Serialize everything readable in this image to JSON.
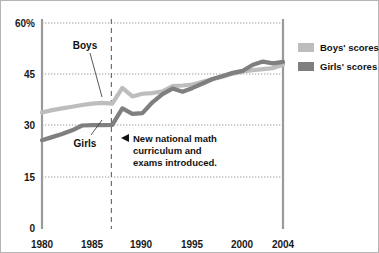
{
  "chart_data": {
    "type": "line",
    "title": "",
    "xlabel": "",
    "ylabel": "",
    "xlim": [
      1980,
      2004
    ],
    "ylim": [
      0,
      60
    ],
    "grid": true,
    "legend_position": "right",
    "y_ticks": [
      "0",
      "15",
      "30",
      "45",
      "60%"
    ],
    "y_tick_values": [
      0,
      15,
      30,
      45,
      60
    ],
    "x_ticks": [
      "1980",
      "1985",
      "1990",
      "1995",
      "2000",
      "2004"
    ],
    "x_tick_values": [
      1980,
      1985,
      1990,
      1995,
      2000,
      2004
    ],
    "x": [
      1980,
      1981,
      1982,
      1983,
      1984,
      1985,
      1986,
      1987,
      1988,
      1989,
      1990,
      1991,
      1992,
      1993,
      1994,
      1995,
      1996,
      1997,
      1998,
      1999,
      2000,
      2001,
      2002,
      2003,
      2004
    ],
    "series": [
      {
        "name": "Boys' scores",
        "color": "#bdbdbd",
        "values": [
          33.8,
          34.5,
          35.0,
          35.5,
          36.0,
          36.4,
          36.6,
          36.4,
          41.0,
          38.5,
          39.3,
          39.5,
          40.0,
          41.5,
          41.7,
          42.0,
          42.8,
          43.6,
          44.3,
          45.2,
          45.8,
          46.2,
          46.5,
          46.8,
          47.8
        ]
      },
      {
        "name": "Girls' scores",
        "color": "#7f7f7f",
        "values": [
          25.7,
          26.6,
          27.5,
          28.6,
          30.0,
          30.1,
          30.1,
          30.2,
          35.0,
          33.4,
          33.6,
          36.8,
          39.2,
          40.8,
          39.9,
          41.0,
          42.3,
          43.6,
          44.5,
          45.4,
          46.0,
          47.8,
          48.7,
          48.2,
          48.6
        ]
      }
    ],
    "annotations": [
      {
        "name": "boys-series-label",
        "text": "Boys",
        "x_frac": 0.222,
        "y_frac": 0.178
      },
      {
        "name": "girls-series-label",
        "text": "Girls",
        "x_frac": 0.222,
        "y_frac": 0.565
      },
      {
        "name": "policy-event-note",
        "line1": "New national math",
        "line2": "curriculum and",
        "line3": "exams introduced.",
        "marker": "left-triangle",
        "event_year": 1987
      }
    ]
  },
  "legend": {
    "items": [
      {
        "label": "Boys' scores",
        "color": "#bdbdbd",
        "swatch": "legend-swatch"
      },
      {
        "label": "Girls' scores",
        "color": "#7f7f7f",
        "swatch": "legend-swatch"
      }
    ]
  },
  "axis": {
    "y_label_60": "60%",
    "y_label_45": "45",
    "y_label_30": "30",
    "y_label_15": "15",
    "y_label_0": "0",
    "x_label_1980": "1980",
    "x_label_1985": "1985",
    "x_label_1990": "1990",
    "x_label_1995": "1995",
    "x_label_2000": "2000",
    "x_label_2004": "2004"
  },
  "annotation": {
    "line1": "New national math",
    "line2": "curriculum and",
    "line3": "exams introduced."
  },
  "series_labels": {
    "boys": "Boys",
    "girls": "Girls"
  },
  "colors": {
    "boys": "#bdbdbd",
    "girls": "#7f7f7f",
    "gridline": "#9a9a9a",
    "axis": "#9a9a9a",
    "text": "#111111",
    "frame": "#b5b5b5"
  }
}
